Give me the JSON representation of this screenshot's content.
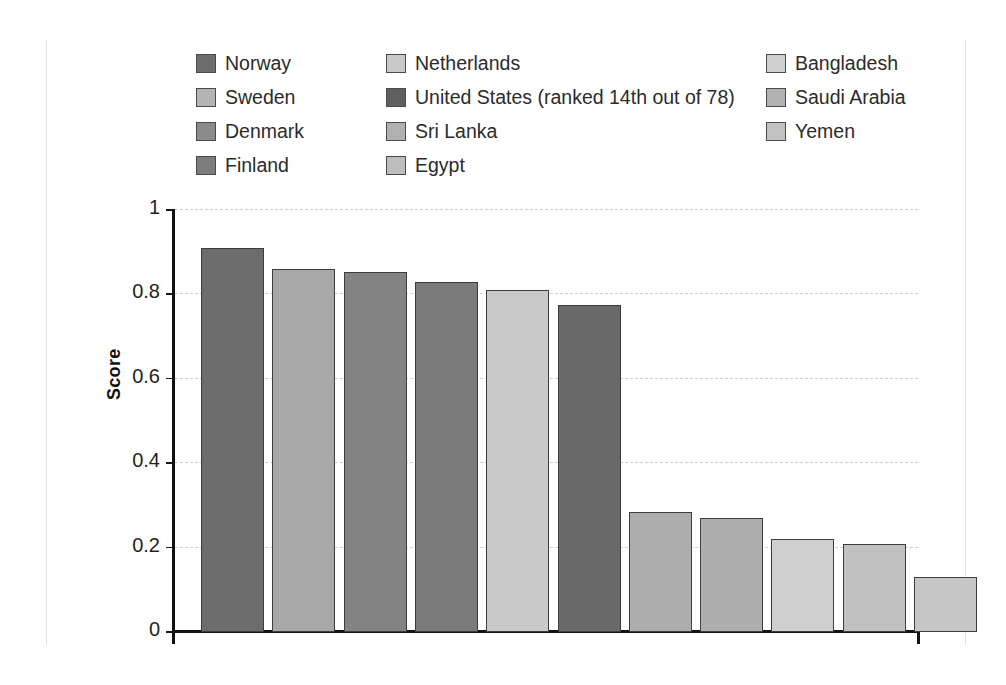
{
  "chart_data": {
    "type": "bar",
    "title": "",
    "xlabel": "",
    "ylabel": "Score",
    "ylim": [
      0,
      1
    ],
    "yticks": [
      "0",
      "0.2",
      "0.4",
      "0.6",
      "0.8",
      "1"
    ],
    "grid": true,
    "legend_position": "top",
    "categories": [
      "Norway",
      "Sweden",
      "Denmark",
      "Finland",
      "Netherlands",
      "United States (ranked 14th out of 78)",
      "Sri Lanka",
      "Egypt",
      "Bangladesh",
      "Saudi Arabia",
      "Yemen"
    ],
    "values": [
      0.908,
      0.857,
      0.851,
      0.827,
      0.808,
      0.772,
      0.281,
      0.267,
      0.219,
      0.207,
      0.127
    ],
    "colors": [
      "#6d6d6d",
      "#a8a8a8",
      "#838383",
      "#7b7b7b",
      "#c9c9c9",
      "#6a6a6a",
      "#adadad",
      "#aeaeae",
      "#cfcfcf",
      "#c1c1c1",
      "#c6c6c6"
    ]
  },
  "legend": {
    "columns": [
      {
        "items": [
          {
            "label": "Norway",
            "color": "#6d6d6d"
          },
          {
            "label": "Sweden",
            "color": "#b4b4b4"
          },
          {
            "label": "Denmark",
            "color": "#8b8b8b"
          },
          {
            "label": "Finland",
            "color": "#7d7d7d"
          }
        ]
      },
      {
        "items": [
          {
            "label": "Netherlands",
            "color": "#c9c9c9"
          },
          {
            "label": "United States (ranked 14th out of 78)",
            "color": "#5f5f5f"
          },
          {
            "label": "Sri Lanka",
            "color": "#b0b0b0"
          },
          {
            "label": "Egypt",
            "color": "#bdbdbd"
          }
        ]
      },
      {
        "items": [
          {
            "label": "Bangladesh",
            "color": "#cfcfcf"
          },
          {
            "label": "Saudi Arabia",
            "color": "#b2b2b2"
          },
          {
            "label": "Yemen",
            "color": "#c2c2c2"
          }
        ]
      }
    ]
  },
  "axis": {
    "y_label": "Score"
  }
}
